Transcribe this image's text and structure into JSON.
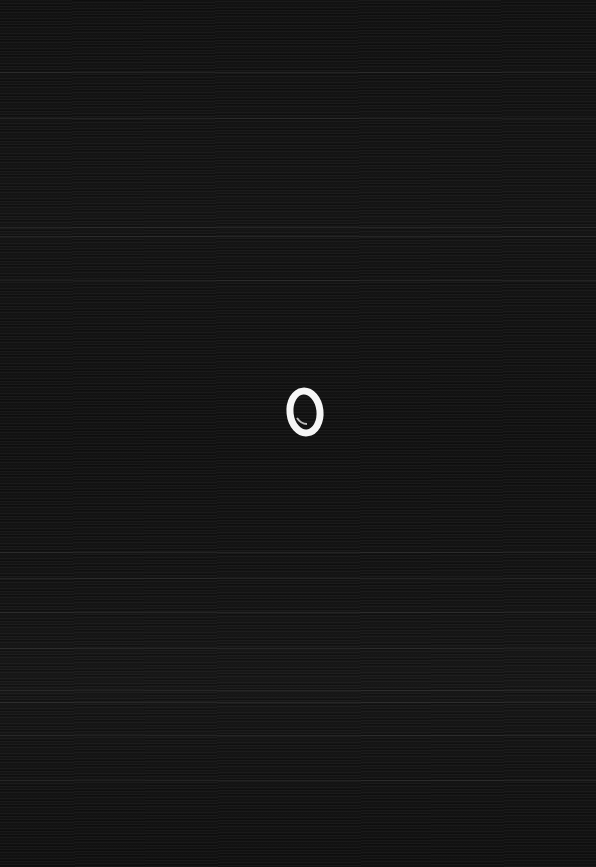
{
  "image": {
    "width": 596,
    "height": 867,
    "background_color": "#131313",
    "stroke_color": "#f5f5f5",
    "digit": "0",
    "streak_rows": [
      72,
      118,
      227,
      236,
      280,
      552,
      578,
      612,
      648,
      690,
      702,
      735,
      780
    ]
  }
}
